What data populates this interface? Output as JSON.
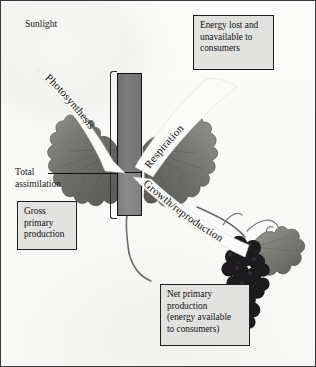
{
  "figure": {
    "type": "energy-flow-diagram"
  },
  "labels": {
    "sunlight": "Sunlight",
    "total_line1": "Total",
    "total_line2": "assimilation"
  },
  "arrows": [
    {
      "id": "photosynthesis",
      "text": "Photosynthesis",
      "direction": "down-right"
    },
    {
      "id": "respiration",
      "text": "Respiration",
      "direction": "up-right"
    },
    {
      "id": "growth",
      "text": "Growth/reproduction",
      "direction": "down-right"
    }
  ],
  "boxes": {
    "energy_lost": {
      "lines": [
        "Energy lost and",
        "unavailable to",
        "consumers"
      ]
    },
    "gross_primary": {
      "lines": [
        "Gross",
        "primary",
        "production"
      ]
    },
    "net_primary": {
      "lines": [
        "Net primary",
        "production",
        "(energy available",
        "to consumers)"
      ]
    }
  },
  "bar": {
    "segments": [
      {
        "name": "respiration-share",
        "label": ""
      },
      {
        "name": "net-production-share",
        "label": ""
      }
    ]
  },
  "colors": {
    "box_fill": "#e2e2e0",
    "box_border": "#1e1e1e",
    "bar_top": "#747474",
    "bar_bottom": "#808080",
    "text": "#121212",
    "page_bg": "#fdfdfc"
  }
}
